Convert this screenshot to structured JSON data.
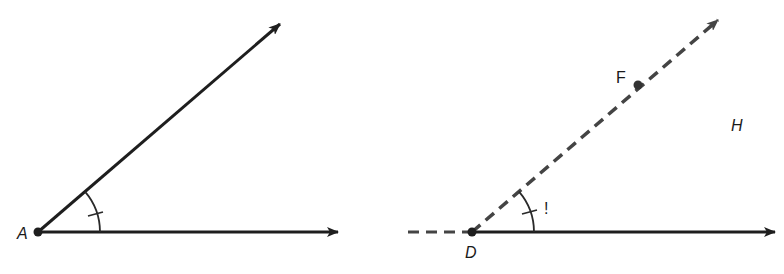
{
  "diagram": {
    "colors": {
      "stroke": "#1e1e1e",
      "dashed": "#444444",
      "background": "#ffffff"
    },
    "left_figure": {
      "vertex_label": "A",
      "vertex": [
        38,
        232
      ],
      "ray_horizontal_end": [
        338,
        232
      ],
      "ray_oblique_end": [
        280,
        24
      ],
      "arc_radius": 62,
      "tick_mark": true
    },
    "right_figure": {
      "vertex_label": "D",
      "vertex": [
        472,
        232
      ],
      "dashed_extension_start": [
        408,
        232
      ],
      "ray_horizontal_end": [
        775,
        232
      ],
      "ray_oblique_end": [
        718,
        20
      ],
      "point_label": "F",
      "point": [
        638,
        85
      ],
      "region_label": "H",
      "arc_mark": "!",
      "arc_radius": 62,
      "tick_mark": true
    }
  }
}
